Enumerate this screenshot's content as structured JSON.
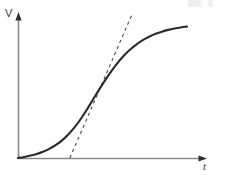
{
  "figure": {
    "name": "sigmoid-growth-curve",
    "background_color": "#ffffff",
    "width": 227,
    "height": 175,
    "axis_color": "#8a8a8a",
    "curve_color": "#2a2a2a",
    "tangent_color": "#4a4a4a"
  },
  "axes": {
    "y_label": "V",
    "x_label": "t",
    "origin_px": [
      18,
      158
    ],
    "y_axis_top_px": [
      18,
      13
    ],
    "x_axis_right_px": [
      207,
      158
    ],
    "ticks": [],
    "tick_labels": [],
    "grid": false
  },
  "chart_data": {
    "type": "line",
    "title": "",
    "subtitle": "",
    "xlabel": "t",
    "ylabel": "V",
    "xlim": [
      0,
      1
    ],
    "ylim": [
      0,
      1
    ],
    "grid": false,
    "legend": null,
    "annotations": [
      {
        "name": "tangent-at-inflection",
        "kind": "dashed-line",
        "description": "Dashed straight line tangent to the sigmoid at its inflection point",
        "x": [
          0.307,
          0.677
        ],
        "y": [
          0.0,
          1.063
        ]
      }
    ],
    "series": [
      {
        "name": "V(t)",
        "style": "solid",
        "color": "#2a2a2a",
        "x": [
          0.0,
          0.037,
          0.074,
          0.111,
          0.148,
          0.185,
          0.222,
          0.259,
          0.296,
          0.333,
          0.37,
          0.407,
          0.444,
          0.481,
          0.519,
          0.556,
          0.593,
          0.63,
          0.667,
          0.704,
          0.741,
          0.778,
          0.815,
          0.852,
          0.889,
          0.926,
          0.963,
          1.0
        ],
        "y": [
          0.0,
          0.008,
          0.018,
          0.03,
          0.046,
          0.067,
          0.094,
          0.128,
          0.171,
          0.223,
          0.285,
          0.355,
          0.43,
          0.505,
          0.578,
          0.645,
          0.705,
          0.757,
          0.801,
          0.838,
          0.868,
          0.893,
          0.913,
          0.929,
          0.942,
          0.952,
          0.96,
          0.966
        ]
      }
    ]
  }
}
